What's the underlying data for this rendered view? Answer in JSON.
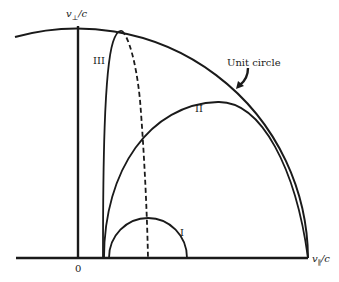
{
  "figure": {
    "axes": {
      "vertical_label": "v⊥/c",
      "vertical_label_main": "v",
      "vertical_label_sub": "⊥",
      "vertical_label_tail": "/c",
      "horizontal_label_main": "v",
      "horizontal_label_sub": "∥",
      "horizontal_label_tail": "/c",
      "origin_label": "0"
    },
    "curves": [
      {
        "id": "I",
        "label": "I"
      },
      {
        "id": "II",
        "label": "II"
      },
      {
        "id": "III",
        "label": "III"
      }
    ],
    "annotations": {
      "unit_circle_label": "Unit circle"
    },
    "colors": {
      "ink": "#1a1a1a",
      "background": "#ffffff"
    }
  }
}
